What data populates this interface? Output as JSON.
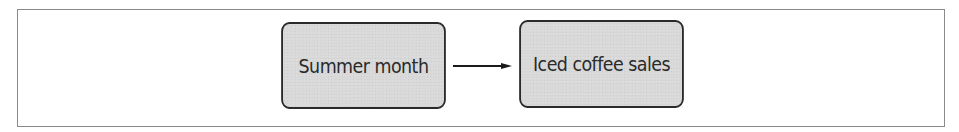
{
  "diagram": {
    "type": "causal-flow",
    "nodes": [
      {
        "id": "summer-month",
        "label": "Summer month"
      },
      {
        "id": "iced-coffee-sales",
        "label": "Iced coffee sales"
      }
    ],
    "edges": [
      {
        "from": "summer-month",
        "to": "iced-coffee-sales",
        "style": "arrow"
      }
    ],
    "colors": {
      "node_fill": "#d9d9d9",
      "node_border": "#2a2a2a",
      "arrow": "#1a1a1a",
      "frame_border": "#8a8a8a"
    }
  }
}
